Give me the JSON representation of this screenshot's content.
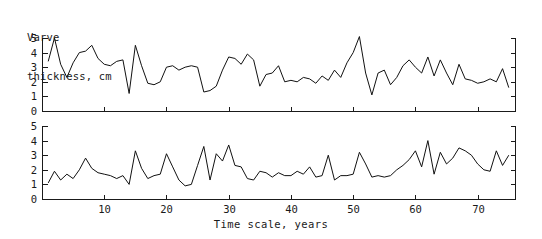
{
  "figure": {
    "title_lines": [
      "Varve",
      "thickness, cm"
    ],
    "xlabel": "Time scale, years",
    "ylabel_text": "Varve thickness, cm"
  },
  "chart_data": {
    "type": "line",
    "title": "Varve thickness, cm",
    "xlabel": "Time scale, years",
    "ylabel": "Varve thickness, cm",
    "xlim": [
      0,
      76
    ],
    "ylim": [
      0,
      5
    ],
    "grid": false,
    "legend": null,
    "xticks": [
      10,
      20,
      30,
      40,
      50,
      60,
      70
    ],
    "xticklabels": [
      "10",
      "20",
      "30",
      "40",
      "50",
      "60",
      "70"
    ],
    "yticks": [
      0,
      1,
      2,
      3,
      4,
      5
    ],
    "yticklabels": [
      "0",
      "1",
      "2",
      "3",
      "4",
      "5"
    ],
    "panels": [
      {
        "name": "upper-panel",
        "x": [
          1,
          2,
          3,
          4,
          5,
          6,
          7,
          8,
          9,
          10,
          11,
          12,
          13,
          14,
          15,
          16,
          17,
          18,
          19,
          20,
          21,
          22,
          23,
          24,
          25,
          26,
          27,
          28,
          29,
          30,
          31,
          32,
          33,
          34,
          35,
          36,
          37,
          38,
          39,
          40,
          41,
          42,
          43,
          44,
          45,
          46,
          47,
          48,
          49,
          50,
          51,
          52,
          53,
          54,
          55,
          56,
          57,
          58,
          59,
          60,
          61,
          62,
          63,
          64,
          65,
          66,
          67,
          68,
          69,
          70,
          71,
          72,
          73,
          74,
          75
        ],
        "values": [
          3.4,
          5.0,
          3.2,
          2.3,
          3.3,
          4.0,
          4.1,
          4.5,
          3.6,
          3.2,
          3.1,
          3.4,
          3.5,
          1.2,
          4.5,
          3.1,
          1.9,
          1.8,
          2.0,
          3.0,
          3.1,
          2.8,
          3.0,
          3.1,
          3.0,
          1.3,
          1.4,
          1.7,
          2.8,
          3.7,
          3.6,
          3.2,
          3.9,
          3.5,
          1.7,
          2.5,
          2.6,
          3.1,
          2.0,
          2.1,
          2.0,
          2.3,
          2.2,
          1.9,
          2.4,
          2.1,
          2.8,
          2.3,
          3.3,
          4.0,
          5.1,
          2.6,
          1.1,
          2.6,
          2.8,
          1.8,
          2.3,
          3.1,
          3.5,
          3.0,
          2.6,
          3.7,
          2.4,
          3.5,
          2.6,
          1.8,
          3.2,
          2.2,
          2.1,
          1.9,
          2.0,
          2.2,
          2.0,
          2.9,
          1.6
        ]
      },
      {
        "name": "lower-panel",
        "x": [
          1,
          2,
          3,
          4,
          5,
          6,
          7,
          8,
          9,
          10,
          11,
          12,
          13,
          14,
          15,
          16,
          17,
          18,
          19,
          20,
          21,
          22,
          23,
          24,
          25,
          26,
          27,
          28,
          29,
          30,
          31,
          32,
          33,
          34,
          35,
          36,
          37,
          38,
          39,
          40,
          41,
          42,
          43,
          44,
          45,
          46,
          47,
          48,
          49,
          50,
          51,
          52,
          53,
          54,
          55,
          56,
          57,
          58,
          59,
          60,
          61,
          62,
          63,
          64,
          65,
          66,
          67,
          68,
          69,
          70,
          71,
          72,
          73,
          74,
          75
        ],
        "values": [
          1.1,
          1.9,
          1.3,
          1.7,
          1.4,
          2.0,
          2.8,
          2.1,
          1.8,
          1.7,
          1.6,
          1.4,
          1.6,
          1.0,
          3.3,
          2.1,
          1.4,
          1.6,
          1.7,
          3.1,
          2.2,
          1.3,
          0.9,
          1.0,
          2.3,
          3.6,
          1.3,
          3.1,
          2.6,
          3.7,
          2.3,
          2.2,
          1.4,
          1.3,
          1.9,
          1.8,
          1.5,
          1.8,
          1.6,
          1.6,
          1.9,
          1.7,
          2.2,
          1.5,
          1.6,
          3.0,
          1.3,
          1.6,
          1.6,
          1.7,
          3.2,
          2.4,
          1.5,
          1.6,
          1.5,
          1.6,
          2.0,
          2.3,
          2.7,
          3.3,
          2.2,
          4.0,
          1.7,
          3.2,
          2.4,
          2.8,
          3.5,
          3.3,
          3.0,
          2.4,
          2.0,
          1.9,
          3.3,
          2.3,
          3.0
        ]
      }
    ]
  }
}
